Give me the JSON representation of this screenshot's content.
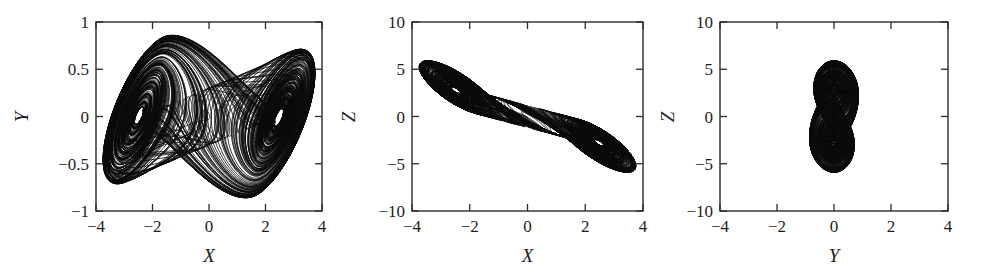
{
  "figure": {
    "name": "chaotic-attractor-projections",
    "background": "#ffffff",
    "stroke_color": "#0b0b0b",
    "panel_count": 3
  },
  "chart_data": [
    {
      "type": "line",
      "name": "panel-xy",
      "title": "",
      "xlabel": "X",
      "ylabel": "Y",
      "xlim": [
        -4,
        4
      ],
      "ylim": [
        -1,
        1
      ],
      "xticks": [
        -4,
        -2,
        0,
        2,
        4
      ],
      "yticks": [
        -1,
        -0.5,
        0,
        0.5,
        1
      ],
      "xticklabels": [
        "−4",
        "−2",
        "0",
        "2",
        "4"
      ],
      "yticklabels": [
        "−1",
        "−0.5",
        "0",
        "0.5",
        "1"
      ],
      "grid": false,
      "legend": false,
      "description": "Double-scroll chaotic attractor projected on the X–Y plane; two lobes centred near (−2, 0.05) and (2, −0.05) joined by a band of cross-over trajectories."
    },
    {
      "type": "line",
      "name": "panel-xz",
      "title": "",
      "xlabel": "X",
      "ylabel": "Z",
      "xlim": [
        -4,
        4
      ],
      "ylim": [
        -10,
        10
      ],
      "xticks": [
        -4,
        -2,
        0,
        2,
        4
      ],
      "yticks": [
        -10,
        -5,
        0,
        5,
        10
      ],
      "xticklabels": [
        "−4",
        "−2",
        "0",
        "2",
        "4"
      ],
      "yticklabels": [
        "−10",
        "−5",
        "0",
        "5",
        "10"
      ],
      "grid": false,
      "legend": false,
      "description": "Projection on the X–Z plane; two thin elongated lobes lie along a descending diagonal from (−3.6, 5.2) to (3.8, −5.4), crossing near the origin."
    },
    {
      "type": "line",
      "name": "panel-yz",
      "title": "",
      "xlabel": "Y",
      "ylabel": "Z",
      "xlim": [
        -4,
        4
      ],
      "ylim": [
        -10,
        10
      ],
      "xticks": [
        -4,
        -2,
        0,
        2,
        4
      ],
      "yticks": [
        -10,
        -5,
        0,
        5,
        10
      ],
      "xticklabels": [
        "−4",
        "−2",
        "0",
        "2",
        "4"
      ],
      "yticklabels": [
        "−10",
        "−5",
        "0",
        "5",
        "10"
      ],
      "grid": false,
      "legend": false,
      "description": "Projection on the Y–Z plane; two overlapping nested ellipse families centred near (0.3, 2.6) and (−0.3, −2.0), spanning Y ∈ [−3.3, 3.4], Z ∈ [−5.6, 6.2]."
    }
  ],
  "panels": [
    {
      "id": "panel-xy",
      "xlabel": "X",
      "ylabel": "Y",
      "xticklabels": [
        "−4",
        "−2",
        "0",
        "2",
        "4"
      ],
      "yticklabels": [
        "1",
        "0.5",
        "0",
        "−0.5",
        "−1"
      ]
    },
    {
      "id": "panel-xz",
      "xlabel": "X",
      "ylabel": "Z",
      "xticklabels": [
        "−4",
        "−2",
        "0",
        "2",
        "4"
      ],
      "yticklabels": [
        "10",
        "5",
        "0",
        "−5",
        "−10"
      ]
    },
    {
      "id": "panel-yz",
      "xlabel": "Y",
      "ylabel": "Z",
      "xticklabels": [
        "−4",
        "−2",
        "0",
        "2",
        "4"
      ],
      "yticklabels": [
        "10",
        "5",
        "0",
        "−5",
        "−10"
      ]
    }
  ]
}
